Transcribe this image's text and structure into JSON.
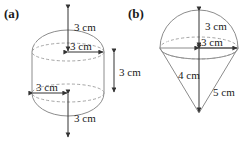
{
  "figure_a": {
    "label": "(a)",
    "shape": "capsule-cylinder-with-hemispherical-caps",
    "dimensions": [
      {
        "name": "top-hemisphere-radius",
        "value": "3 cm"
      },
      {
        "name": "top-circle-radius",
        "value": "3 cm"
      },
      {
        "name": "bottom-circle-radius",
        "value": "3 cm"
      },
      {
        "name": "bottom-hemisphere-radius",
        "value": "3 cm"
      },
      {
        "name": "cylinder-height",
        "value": "3 cm"
      }
    ]
  },
  "figure_b": {
    "label": "(b)",
    "shape": "hemisphere-on-inverted-cone",
    "dimensions": [
      {
        "name": "hemisphere-height",
        "value": "3 cm"
      },
      {
        "name": "base-radius",
        "value": "3 cm"
      },
      {
        "name": "cone-height",
        "value": "4 cm"
      },
      {
        "name": "cone-slant-height",
        "value": "5 cm"
      }
    ]
  },
  "colors": {
    "fill_light": "#eeeeee",
    "fill_mid": "#e0e0e0",
    "fill_dark": "#d2d2d2",
    "edge": "#8c8c8c",
    "hidden_edge": "#9a9a9a",
    "arrow": "#333333",
    "text": "#1a1a1a",
    "background": "#ffffff"
  }
}
